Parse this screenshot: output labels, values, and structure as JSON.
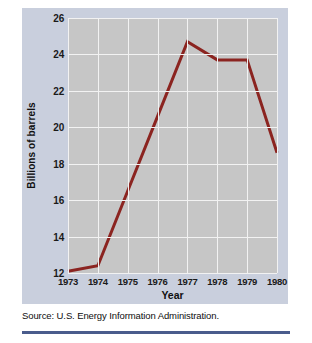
{
  "figure": {
    "caption": "Source: U.S. Energy Information Administration.",
    "accent_color": "#4a5c8c",
    "panel_color": "#c9cfdd",
    "plot_bg_color": "#c6c6c6",
    "gridline_color": "#f2f2f2"
  },
  "chart_data": {
    "type": "line",
    "title": "",
    "xlabel": "Year",
    "ylabel": "Billions of barrels",
    "categories": [
      "1973",
      "1974",
      "1975",
      "1976",
      "1977",
      "1978",
      "1979",
      "1980"
    ],
    "x": [
      1973,
      1974,
      1975,
      1976,
      1977,
      1978,
      1979,
      1980
    ],
    "values": [
      12.1,
      12.4,
      16.5,
      20.6,
      24.7,
      23.7,
      23.7,
      18.6
    ],
    "series": [
      {
        "name": "Proved reserves of crude oil",
        "color": "#8b2420",
        "values": [
          12.1,
          12.4,
          16.5,
          20.6,
          24.7,
          23.7,
          23.7,
          18.6
        ]
      }
    ],
    "xlim": [
      1973,
      1980
    ],
    "ylim": [
      12,
      26
    ],
    "yticks": [
      12,
      14,
      16,
      18,
      20,
      22,
      24,
      26
    ],
    "ytick_labels": [
      "12",
      "14",
      "16",
      "18",
      "20",
      "22",
      "24",
      "26"
    ],
    "xtick_labels": [
      "1973",
      "1974",
      "1975",
      "1976",
      "1977",
      "1978",
      "1979",
      "1980"
    ],
    "grid": true,
    "legend": "none",
    "line_width": 3
  }
}
